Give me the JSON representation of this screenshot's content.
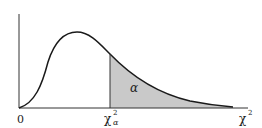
{
  "diagram": {
    "labels": {
      "origin": "0",
      "critical_base": "χ",
      "critical_sup": "2",
      "critical_sub": "α",
      "axis_base": "χ",
      "axis_sup": "2",
      "area": "α"
    },
    "colors": {
      "curve": "#1a1a1a",
      "shade": "#c9c9c9",
      "axis": "#333333",
      "background": "#ffffff"
    }
  }
}
